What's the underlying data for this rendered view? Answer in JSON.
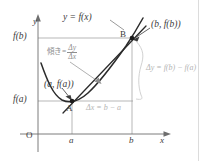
{
  "figure": {
    "kind": "math-diagram",
    "background_color": "#ffffff",
    "page_rule_x": 198,
    "page_rule_color": "#dcdcdc"
  },
  "axes": {
    "y_axis_label": "y",
    "x_axis_label": "x",
    "origin_label": "O",
    "axis_color": "#6e6e6e",
    "origin_x": 38,
    "origin_y": 134
  },
  "curve": {
    "label": "y = f(x)",
    "color": "#2b2b2b",
    "type": "parabola"
  },
  "secant": {
    "color": "#2b2b2b",
    "from_point": "A",
    "to_point": "B"
  },
  "points": {
    "a": {
      "tick_label": "a",
      "point_label": "A",
      "coord_label": "(a, f(a))",
      "value_label": "f(a)",
      "x": 72,
      "y": 101
    },
    "b": {
      "tick_label": "b",
      "point_label": "B",
      "coord_label": "(b, f(b))",
      "value_label": "f(b)",
      "x": 132,
      "y": 38
    }
  },
  "annotations": {
    "slope": {
      "prefix": "傾き",
      "equals": "=",
      "numerator": "Δy",
      "denominator": "Δx",
      "color": "#8e8e8e"
    },
    "delta_y": {
      "text": "Δy = f(b) − f(a)",
      "color": "#c8c8c8"
    },
    "delta_x": {
      "text": "Δx = b − a",
      "color": "#bcbcbc"
    }
  },
  "guides": {
    "color": "#9a9a9a",
    "brace_color": "#d2d2d2"
  }
}
